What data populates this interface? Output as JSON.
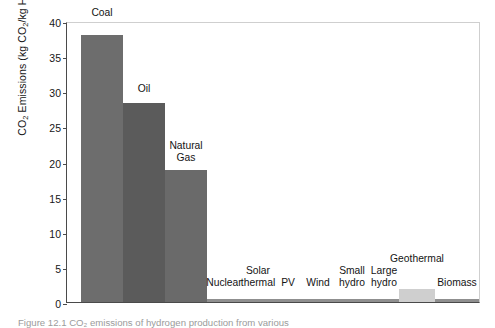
{
  "figure": {
    "caption_partial": "Figure 12.1   CO₂ emissions of hydrogen production from various"
  },
  "chart_data": {
    "type": "bar",
    "title": "",
    "xlabel": "",
    "ylabel": "CO2 Emissions (kg CO2/kg H2)",
    "ylim": [
      0,
      40
    ],
    "yticks": [
      0,
      5,
      10,
      15,
      20,
      25,
      30,
      35,
      40
    ],
    "grid": false,
    "legend": "none",
    "categories": [
      "Coal",
      "Oil",
      "Natural Gas",
      "Nuclear",
      "Solar thermal",
      "PV",
      "Wind",
      "Small hydro",
      "Large hydro",
      "Geothermal",
      "Biomass"
    ],
    "values": [
      38.0,
      28.3,
      18.8,
      0.5,
      0.4,
      0.4,
      0.4,
      0.5,
      0.4,
      1.8,
      0.4
    ],
    "colors": [
      "#6d6d6d",
      "#5b5b5b",
      "#6a6a6a",
      "#8f8f8f",
      "#8f8f8f",
      "#8f8f8f",
      "#8f8f8f",
      "#8f8f8f",
      "#8f8f8f",
      "#cfcfcf",
      "#8f8f8f"
    ],
    "label_lines": [
      [
        "Coal"
      ],
      [
        "Oil"
      ],
      [
        "Natural",
        "Gas"
      ],
      [
        "Nuclear"
      ],
      [
        "Solar",
        "thermal"
      ],
      [
        "PV"
      ],
      [
        "Wind"
      ],
      [
        "Small",
        "hydro"
      ],
      [
        "Large",
        "hydro"
      ],
      [
        "Geothermal"
      ],
      [
        "Biomass"
      ]
    ]
  },
  "axis": {
    "tick_labels": [
      "0",
      "5",
      "10",
      "15",
      "20",
      "25",
      "30",
      "35",
      "40"
    ],
    "y_title_main": "CO",
    "y_title_sub1": "2",
    "y_title_mid": " Emissions (kg CO",
    "y_title_sub2": "2",
    "y_title_mid2": "/kg H",
    "y_title_sub3": "2",
    "y_title_end": ")"
  }
}
